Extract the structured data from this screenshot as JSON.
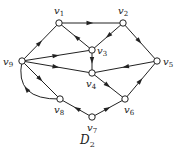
{
  "caption": {
    "main": "D",
    "sub": "2"
  },
  "nodes": [
    {
      "id": "v1",
      "letter": "v",
      "sub": "1",
      "x": 59,
      "y": 23,
      "lx": 54,
      "ly": 14
    },
    {
      "id": "v2",
      "letter": "v",
      "sub": "2",
      "x": 123,
      "y": 23,
      "lx": 118,
      "ly": 14
    },
    {
      "id": "v3",
      "letter": "v",
      "sub": "3",
      "x": 92,
      "y": 50,
      "lx": 97,
      "ly": 54
    },
    {
      "id": "v4",
      "letter": "v",
      "sub": "4",
      "x": 92,
      "y": 73,
      "lx": 86,
      "ly": 87
    },
    {
      "id": "v5",
      "letter": "v",
      "sub": "5",
      "x": 157,
      "y": 61,
      "lx": 163,
      "ly": 65
    },
    {
      "id": "v6",
      "letter": "v",
      "sub": "6",
      "x": 125,
      "y": 99,
      "lx": 124,
      "ly": 113
    },
    {
      "id": "v7",
      "letter": "v",
      "sub": "7",
      "x": 92,
      "y": 117,
      "lx": 87,
      "ly": 131
    },
    {
      "id": "v8",
      "letter": "v",
      "sub": "8",
      "x": 60,
      "y": 99,
      "lx": 54,
      "ly": 113
    },
    {
      "id": "v9",
      "letter": "v",
      "sub": "9",
      "x": 22,
      "y": 61,
      "lx": 3,
      "ly": 65
    }
  ],
  "edges": [
    {
      "from": "v1",
      "to": "v2"
    },
    {
      "from": "v2",
      "to": "v3"
    },
    {
      "from": "v2",
      "to": "v5"
    },
    {
      "from": "v3",
      "to": "v1"
    },
    {
      "from": "v3",
      "to": "v4"
    },
    {
      "from": "v9",
      "to": "v1"
    },
    {
      "from": "v9",
      "to": "v3"
    },
    {
      "from": "v9",
      "to": "v4"
    },
    {
      "from": "v5",
      "to": "v4"
    },
    {
      "from": "v4",
      "to": "v6"
    },
    {
      "from": "v6",
      "to": "v5"
    },
    {
      "from": "v7",
      "to": "v6"
    },
    {
      "from": "v7",
      "to": "v8"
    },
    {
      "from": "v9",
      "to": "v8"
    },
    {
      "from": "v8",
      "to": "v9",
      "curved": true
    }
  ]
}
